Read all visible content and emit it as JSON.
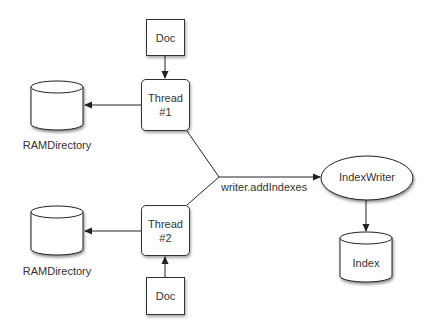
{
  "diagram": {
    "nodes": {
      "doc1": {
        "label": "Doc"
      },
      "thread1": {
        "label": "Thread\n#1"
      },
      "ramdir1": {
        "label": "RAMDirectory"
      },
      "thread2": {
        "label": "Thread\n#2"
      },
      "doc2": {
        "label": "Doc"
      },
      "ramdir2": {
        "label": "RAMDirectory"
      },
      "indexwriter": {
        "label": "IndexWriter"
      },
      "index": {
        "label": "Index"
      }
    },
    "edges": [
      {
        "from": "doc1",
        "to": "thread1"
      },
      {
        "from": "thread1",
        "to": "ramdir1"
      },
      {
        "from": "doc2",
        "to": "thread2"
      },
      {
        "from": "thread2",
        "to": "ramdir2"
      },
      {
        "from": "thread1",
        "to": "indexwriter",
        "label": "writer.addIndexes"
      },
      {
        "from": "thread2",
        "to": "indexwriter",
        "label": "writer.addIndexes"
      },
      {
        "from": "indexwriter",
        "to": "index"
      }
    ],
    "merge_label": "writer.addIndexes"
  }
}
